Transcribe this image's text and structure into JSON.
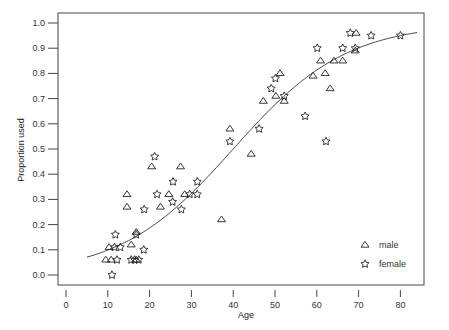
{
  "chart_data": {
    "type": "scatter",
    "title": "",
    "xlabel": "Age",
    "ylabel": "Proportion used",
    "xlim": [
      0,
      85
    ],
    "ylim": [
      0.0,
      1.0
    ],
    "x_ticks": [
      "0",
      "10",
      "20",
      "30",
      "40",
      "50",
      "60",
      "70",
      "80"
    ],
    "y_ticks": [
      "0.0",
      "0.1",
      "0.2",
      "0.3",
      "0.4",
      "0.5",
      "0.6",
      "0.7",
      "0.8",
      "0.9",
      "1.0"
    ],
    "grid": false,
    "legend_position": "lower right",
    "legend": [
      {
        "label": "male",
        "marker": "triangle"
      },
      {
        "label": "female",
        "marker": "star"
      }
    ],
    "series": [
      {
        "name": "male",
        "marker": "triangle",
        "points": [
          [
            9.5,
            0.06
          ],
          [
            10.8,
            0.06
          ],
          [
            10.3,
            0.11
          ],
          [
            15.6,
            0.12
          ],
          [
            16.8,
            0.06
          ],
          [
            16.8,
            0.17
          ],
          [
            14.6,
            0.32
          ],
          [
            14.6,
            0.27
          ],
          [
            20.5,
            0.43
          ],
          [
            22.6,
            0.27
          ],
          [
            24.6,
            0.32
          ],
          [
            27.4,
            0.43
          ],
          [
            28.4,
            0.32
          ],
          [
            37.2,
            0.22
          ],
          [
            39.2,
            0.58
          ],
          [
            44.3,
            0.48
          ],
          [
            47.2,
            0.69
          ],
          [
            50.2,
            0.71
          ],
          [
            51.2,
            0.8
          ],
          [
            52.2,
            0.69
          ],
          [
            59.1,
            0.79
          ],
          [
            60.9,
            0.85
          ],
          [
            62.0,
            0.8
          ],
          [
            63.2,
            0.74
          ],
          [
            64.1,
            0.85
          ],
          [
            66.2,
            0.85
          ],
          [
            69.2,
            0.89
          ],
          [
            69.4,
            0.96
          ]
        ]
      },
      {
        "name": "female",
        "marker": "star",
        "points": [
          [
            11.0,
            0.0
          ],
          [
            12.2,
            0.06
          ],
          [
            11.8,
            0.16
          ],
          [
            11.6,
            0.11
          ],
          [
            13.0,
            0.11
          ],
          [
            15.6,
            0.06
          ],
          [
            16.4,
            0.06
          ],
          [
            17.4,
            0.06
          ],
          [
            16.8,
            0.16
          ],
          [
            18.6,
            0.1
          ],
          [
            18.7,
            0.26
          ],
          [
            21.2,
            0.47
          ],
          [
            21.8,
            0.32
          ],
          [
            25.5,
            0.29
          ],
          [
            25.6,
            0.37
          ],
          [
            27.6,
            0.26
          ],
          [
            29.6,
            0.32
          ],
          [
            31.4,
            0.32
          ],
          [
            31.4,
            0.37
          ],
          [
            39.2,
            0.53
          ],
          [
            46.2,
            0.58
          ],
          [
            49.1,
            0.74
          ],
          [
            50.1,
            0.78
          ],
          [
            52.2,
            0.71
          ],
          [
            57.2,
            0.63
          ],
          [
            60.1,
            0.9
          ],
          [
            62.2,
            0.53
          ],
          [
            66.2,
            0.9
          ],
          [
            68.0,
            0.96
          ],
          [
            69.2,
            0.9
          ],
          [
            73.0,
            0.95
          ],
          [
            80.0,
            0.95
          ]
        ]
      }
    ],
    "fitted_curve": {
      "type": "logistic",
      "description": "Fitted logistic curve p = 1/(1+exp(-b*(age - x50)))",
      "x50": 40,
      "slope": 0.0736,
      "x_range": [
        5,
        84
      ]
    }
  }
}
